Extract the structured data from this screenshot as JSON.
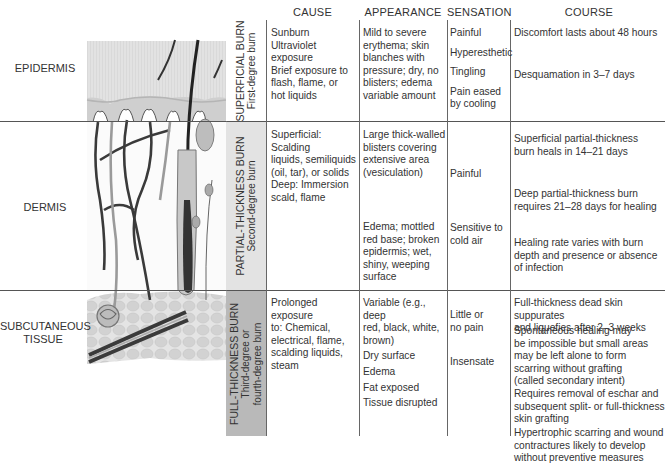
{
  "headers": {
    "cause": "CAUSE",
    "appearance": "APPEARANCE",
    "sensation": "SENSATION",
    "course": "COURSE"
  },
  "layers": {
    "epidermis": "EPIDERMIS",
    "dermis": "DERMIS",
    "subcutaneous_line1": "SUBCUTANEOUS",
    "subcutaneous_line2": "TISSUE"
  },
  "rows": [
    {
      "title": "SUPERFICIAL BURN",
      "subtitle": "First-degree burn",
      "band_color": "#ffffff",
      "cause": [
        "Sunburn",
        "Ultraviolet exposure",
        "Brief exposure to",
        "flash, flame, or",
        "hot liquids"
      ],
      "appearance": [
        "Mild to severe",
        "erythema; skin",
        "blanches with",
        "pressure; dry, no",
        "blisters; edema",
        "variable amount"
      ],
      "sensation": [
        "Painful",
        "Hyperesthetic",
        "Tingling",
        "Pain eased",
        "by cooling"
      ],
      "course": [
        "Discomfort lasts about 48 hours",
        "Desquamation in 3–7 days"
      ]
    },
    {
      "title": "PARTIAL-THICKNESS BURN",
      "subtitle": "Second-degree burn",
      "band_color": "#e3e3e3",
      "cause": [
        "Superficial: Scalding",
        "liquids, semiliquids",
        "(oil, tar), or solids",
        "Deep: Immersion",
        "scald, flame"
      ],
      "appearance_a": [
        "Large thick-walled",
        "blisters covering",
        "extensive area",
        "(vesiculation)"
      ],
      "appearance_b": [
        "Edema; mottled",
        "red base; broken",
        "epidermis; wet,",
        "shiny, weeping",
        "surface"
      ],
      "sensation_a": "Painful",
      "sensation_b": [
        "Sensitive to",
        "cold air"
      ],
      "course_a": [
        "Superficial partial-thickness",
        "burn heals in 14–21 days"
      ],
      "course_b": [
        "Deep partial-thickness burn",
        "requires 21–28 days for healing"
      ],
      "course_c": [
        "Healing rate varies with burn",
        "depth and presence or absence",
        "of infection"
      ]
    },
    {
      "title": "FULL-THICKNESS BURN",
      "subtitle_line1": "Third-degree or",
      "subtitle_line2": "fourth-degree burn",
      "band_color": "#b9b9b9",
      "cause": [
        "Prolonged exposure",
        "to: Chemical,",
        "electrical, flame,",
        "scalding liquids,",
        "steam"
      ],
      "appearance": [
        "Variable (e.g., deep",
        "red, black, white,",
        "brown)",
        "Dry surface",
        "Edema",
        "Fat exposed",
        "Tissue disrupted"
      ],
      "sensation_a": [
        "Little or",
        "no pain"
      ],
      "sensation_b": "Insensate",
      "course_a": [
        "Full-thickness dead skin suppurates",
        "and liquefies after 2–3 weeks"
      ],
      "course_b": [
        "Spontaneous healing may",
        "be impossible but small areas",
        "may be left alone to form",
        "scarring without grafting",
        "(called secondary intent)"
      ],
      "course_c": [
        "Requires removal of eschar and",
        "subsequent split- or full-thickness",
        "skin grafting"
      ],
      "course_d": [
        "Hypertrophic scarring and wound",
        "contractures likely to develop",
        "without preventive measures"
      ]
    }
  ],
  "colors": {
    "epidermis_fill": "#dcdcdc",
    "vessel_dark": "#3a3a3a",
    "vessel_light": "#9a9a9a",
    "fat_fill": "#cfcfcf"
  }
}
